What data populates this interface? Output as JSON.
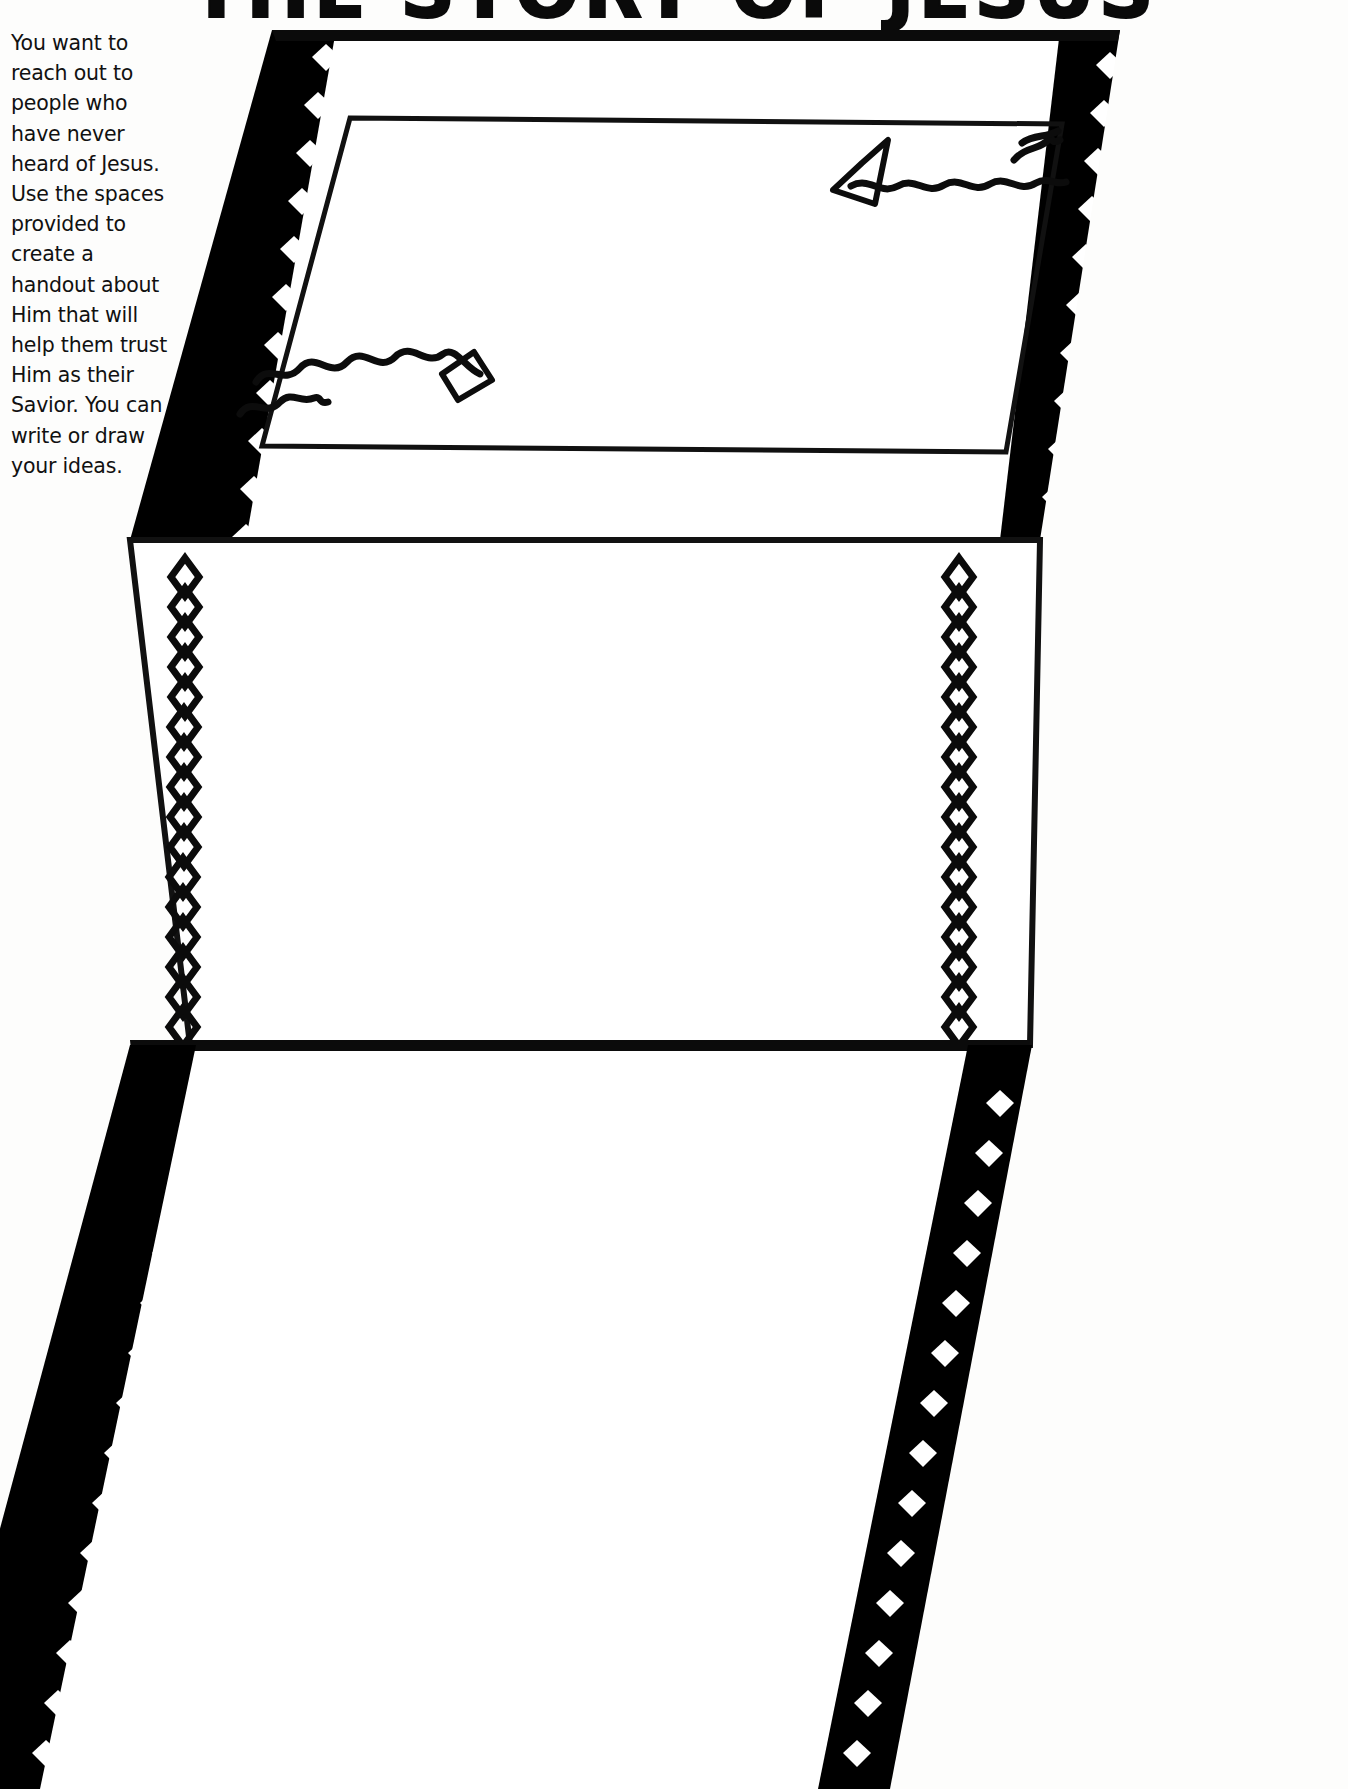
{
  "page": {
    "title": "THE STORY OF JESUS",
    "title_note": "cropped at top edge of scan",
    "background_color": "#ffffff",
    "ink_color": "#000000",
    "width": 1348,
    "height": 1789
  },
  "instructions": {
    "text": "You want to reach out to people who have never heard of Jesus. Use the spaces provided to create a handout about Him that will help them trust Him as their Savior. You can write or draw your ideas.",
    "lines": [
      "You want to reach",
      "out to people who",
      "have never heard",
      "of Jesus. Use",
      "the spaces",
      "provided to",
      "create a",
      "handout",
      "about Him",
      "that will",
      "help them",
      "trust Him",
      "as their",
      "Savior.",
      "You can",
      "write or",
      "draw",
      "your",
      "ideas."
    ]
  },
  "artwork": {
    "name": "tri-fold-brochure-perspective",
    "description": "Three-panel folded handout drawn in perspective with diamond-studded black side bands",
    "panels": [
      {
        "id": "top-panel",
        "label": "upper fold panel",
        "has_inner_frame": true,
        "content": "two handwriting scribble marks"
      },
      {
        "id": "middle-panel",
        "label": "middle fold panel",
        "has_inner_frame": false,
        "content": "blank writing area with diamond rails"
      },
      {
        "id": "bottom-panel",
        "label": "lower fold panel",
        "has_inner_frame": false,
        "content": "blank writing area"
      }
    ],
    "ornament": {
      "name": "diamond",
      "glyph": "◇",
      "count_left_middle": 16,
      "count_right_middle": 16
    },
    "scribbles": [
      {
        "id": "scribble-top-right",
        "note": "squiggle line with diamond cap"
      },
      {
        "id": "scribble-mid-left",
        "note": "squiggle lines with diamond cap"
      }
    ]
  }
}
